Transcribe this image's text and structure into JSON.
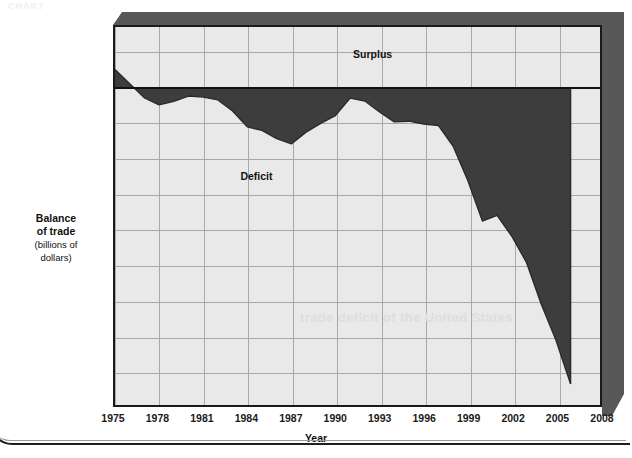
{
  "figure": {
    "ghost_header": "CHART",
    "bleed_text": "trade deficit of the United States"
  },
  "axes": {
    "y_title_bold": "Balance\nof trade",
    "y_title_line1": "Balance",
    "y_title_line2": "of trade",
    "y_title_line3": "(billions of",
    "y_title_line4": "dollars)",
    "x_title": "Year",
    "y_ticks": [
      "100",
      "0",
      "−100",
      "−200",
      "−300",
      "−400",
      "−500",
      "−600",
      "−700",
      "−800",
      "−900"
    ],
    "x_ticks": [
      "1975",
      "1978",
      "1981",
      "1984",
      "1987",
      "1990",
      "1993",
      "1996",
      "1999",
      "2002",
      "2005",
      "2008"
    ]
  },
  "annotations": {
    "surplus": "Surplus",
    "deficit": "Deficit"
  },
  "colors": {
    "deficit_fill": "#3d3d3d",
    "plot_background": "#e9e9e9",
    "gridline": "#a9a9a9",
    "axis": "#1a1a1a",
    "bevel": "#585858"
  },
  "chart_data": {
    "type": "area",
    "title": "",
    "xlabel": "Year",
    "ylabel": "Balance of trade (billions of dollars)",
    "xlim": [
      1975,
      2008
    ],
    "ylim": [
      -900,
      170
    ],
    "grid": true,
    "legend": "none",
    "baseline": 0,
    "annotations": [
      {
        "text": "Surplus",
        "x": 1991.2,
        "y": 85
      },
      {
        "text": "Deficit",
        "x": 1983.6,
        "y": -255
      }
    ],
    "x": [
      1975,
      1976,
      1977,
      1978,
      1979,
      1980,
      1981,
      1982,
      1983,
      1984,
      1985,
      1986,
      1987,
      1988,
      1989,
      1990,
      1991,
      1992,
      1993,
      1994,
      1995,
      1996,
      1997,
      1998,
      1999,
      2000,
      2001,
      2002,
      2003,
      2004,
      2005,
      2006
    ],
    "values": [
      50,
      10,
      -30,
      -50,
      -40,
      -25,
      -28,
      -36,
      -67,
      -112,
      -122,
      -145,
      -160,
      -127,
      -102,
      -80,
      -31,
      -39,
      -70,
      -98,
      -96,
      -104,
      -108,
      -166,
      -263,
      -378,
      -362,
      -421,
      -495,
      -612,
      -714,
      -838
    ],
    "series": [
      {
        "name": "U.S. balance of trade",
        "values": [
          50,
          10,
          -30,
          -50,
          -40,
          -25,
          -28,
          -36,
          -67,
          -112,
          -122,
          -145,
          -160,
          -127,
          -102,
          -80,
          -31,
          -39,
          -70,
          -98,
          -96,
          -104,
          -108,
          -166,
          -263,
          -378,
          -362,
          -421,
          -495,
          -612,
          -714,
          -838
        ]
      }
    ]
  }
}
